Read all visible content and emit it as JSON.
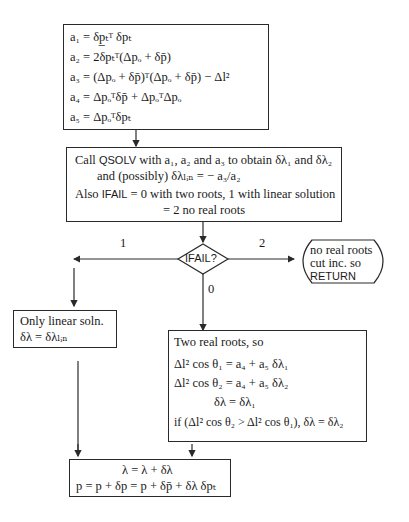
{
  "coeff_box": {
    "lines": [
      "a₁ = δp̲ₜᵀ δpₜ",
      "a₂ = 2δpₜᵀ(Δpₒ + δp̄)",
      "a₃ = (Δpₒ + δp̄)ᵀ(Δpₒ + δp̄) − Δl²",
      "a₄ = Δpₒᵀδp̄ + ΔpₒᵀΔpₒ",
      "a₅ = Δpₒᵀδpₜ"
    ]
  },
  "qsolv_box": {
    "line1_prefix": "Call ",
    "line1_routine": "QSOLV",
    "line1_suffix": " with a₁, a₂ and a₃ to obtain δλ₁ and δλ₂",
    "line2": "and (possibly) δλₗᵢₙ = − a₃/a₂",
    "line3_prefix": "Also ",
    "line3_flag": "IFAIL",
    "line3_suffix": " = 0 with two roots, 1 with linear solution",
    "line4": "= 2 no real roots"
  },
  "decision": {
    "label": "IFAIL?",
    "branch_left": "1",
    "branch_right": "2",
    "branch_down": "0"
  },
  "no_roots_box": {
    "line1": "no real roots",
    "line2": "cut inc. so",
    "line3": "RETURN"
  },
  "linear_box": {
    "line1": "Only linear soln.",
    "line2": "δλ = δλₗᵢₙ"
  },
  "two_roots_box": {
    "line1": "Two real roots, so",
    "line2": "Δl² cos θ₁ = a₄ + a₅ δλ₁",
    "line3": "Δl² cos θ₂ = a₄ + a₅ δλ₂",
    "line4": "δλ = δλ₁",
    "line5": "if (Δl² cos θ₂ > Δl² cos θ₁), δλ = δλ₂"
  },
  "update_box": {
    "line1": "λ = λ + δλ",
    "line2": "p = p + δp = p + δp̄ + δλ δpₜ"
  }
}
